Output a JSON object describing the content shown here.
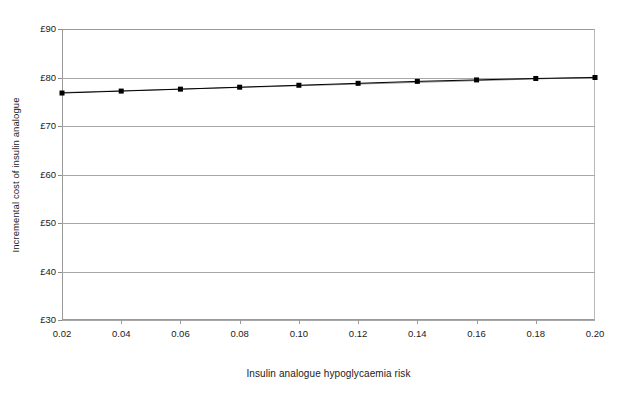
{
  "chart_data": {
    "type": "line",
    "title": "",
    "xlabel": "Insulin analogue hypoglycaemia risk",
    "ylabel": "Incremental cost of insulin analogue",
    "x": [
      0.02,
      0.04,
      0.06,
      0.08,
      0.1,
      0.12,
      0.14,
      0.16,
      0.18,
      0.2
    ],
    "xtick_labels": [
      "0.02",
      "0.04",
      "0.06",
      "0.08",
      "0.10",
      "0.12",
      "0.14",
      "0.16",
      "0.18",
      "0.20"
    ],
    "ytick_labels": [
      "£90",
      "£80",
      "£70",
      "£60",
      "£50",
      "£40",
      "£30"
    ],
    "ytick_values": [
      90,
      80,
      70,
      60,
      50,
      40,
      30
    ],
    "xlim": [
      0.02,
      0.2
    ],
    "ylim": [
      30,
      90
    ],
    "grid": "horizontal",
    "legend": "none",
    "series": [
      {
        "name": "Incremental cost of insulin analogue",
        "marker": "square",
        "color": "#000000",
        "values": [
          76.8,
          77.2,
          77.6,
          78.0,
          78.4,
          78.8,
          79.2,
          79.5,
          79.8,
          80.0
        ]
      }
    ],
    "secondary_line": {
      "name": "trend-overlay",
      "color": "#8c8c8c",
      "values": [
        76.9,
        77.25,
        77.6,
        77.95,
        78.3,
        78.65,
        79.0,
        79.35,
        79.7,
        80.05
      ]
    }
  },
  "axes": {
    "y_title": "Incremental cost of insulin analogue",
    "x_title": "Insulin analogue hypoglycaemia risk"
  },
  "footer": {
    "clipped_caption": ""
  }
}
